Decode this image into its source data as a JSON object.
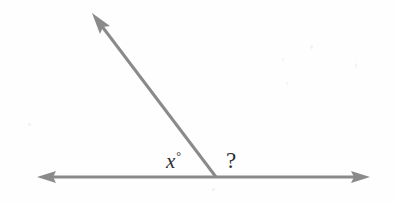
{
  "figure": {
    "type": "geometry-diagram",
    "background_color": "#fefefe",
    "stroke_color": "#8a8a8a",
    "text_color": "#2f2f33",
    "width": 395,
    "height": 203
  },
  "labels": {
    "unknown_angle_variable": "x",
    "degree_symbol": "°",
    "question_angle": "?"
  },
  "geometry": {
    "vertex": {
      "x": 216,
      "y": 177
    },
    "horizontal_line": {
      "name": "straight-line",
      "left_tip": {
        "x": 37,
        "y": 177
      },
      "right_tip": {
        "x": 370,
        "y": 177
      },
      "double_headed": true
    },
    "ray": {
      "name": "slanted-ray",
      "start": {
        "x": 216,
        "y": 177
      },
      "tip": {
        "x": 92,
        "y": 13
      },
      "double_headed": false
    },
    "label_positions": {
      "x_label": {
        "x": 178,
        "y": 163
      },
      "question_label": {
        "x": 233,
        "y": 162
      }
    }
  }
}
